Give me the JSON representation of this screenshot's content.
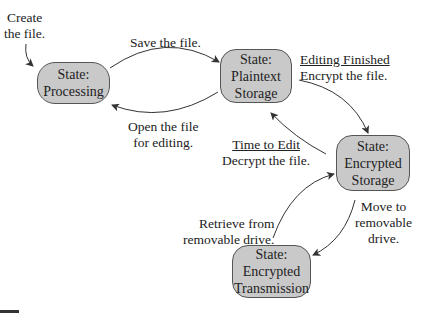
{
  "diagram": {
    "type": "state-transition",
    "nodes": [
      {
        "id": "processing",
        "lines": [
          "State:",
          "Processing"
        ]
      },
      {
        "id": "plaintext",
        "lines": [
          "State:",
          "Plaintext",
          "Storage"
        ]
      },
      {
        "id": "encrypted_storage",
        "lines": [
          "State:",
          "Encrypted",
          "Storage"
        ]
      },
      {
        "id": "encrypted_transmission",
        "lines": [
          "State:",
          "Encrypted",
          "Transmission"
        ]
      }
    ],
    "labels": {
      "create": [
        "Create",
        "the file."
      ],
      "save": [
        "Save the file."
      ],
      "open": [
        "Open the file",
        "for editing."
      ],
      "encrypt": {
        "heading": "Editing Finished",
        "text": "Encrypt the file."
      },
      "decrypt": {
        "heading": "Time to Edit",
        "text": "Decrypt the file."
      },
      "move": [
        "Move to",
        "removable",
        "drive."
      ],
      "retrieve": [
        "Retrieve from",
        "removable drive."
      ]
    },
    "edges": [
      {
        "from": "start",
        "to": "processing",
        "label": "Create the file."
      },
      {
        "from": "processing",
        "to": "plaintext",
        "label": "Save the file."
      },
      {
        "from": "plaintext",
        "to": "processing",
        "label": "Open the file for editing."
      },
      {
        "from": "plaintext",
        "to": "encrypted_storage",
        "label": "Editing Finished / Encrypt the file."
      },
      {
        "from": "encrypted_storage",
        "to": "plaintext",
        "label": "Time to Edit / Decrypt the file."
      },
      {
        "from": "encrypted_storage",
        "to": "encrypted_transmission",
        "label": "Move to removable drive."
      },
      {
        "from": "encrypted_transmission",
        "to": "encrypted_storage",
        "label": "Retrieve from removable drive."
      }
    ],
    "colors": {
      "node_fill": "#c9c9c9",
      "node_border": "#555555",
      "edge": "#333333"
    }
  }
}
